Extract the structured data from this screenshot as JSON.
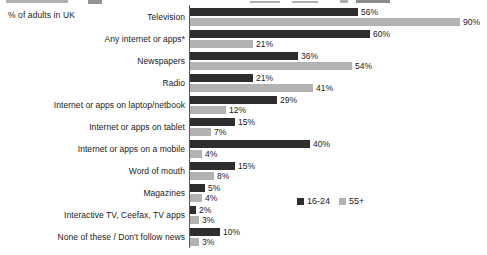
{
  "axis_caption": "% of adults in UK",
  "legend": {
    "position": "inside-right-middle",
    "entries": [
      {
        "label": "16-24",
        "color": "#2e2e2e"
      },
      {
        "label": "55+",
        "color": "#b2b2b2"
      }
    ]
  },
  "chart_data": {
    "type": "bar",
    "orientation": "horizontal",
    "title": "",
    "subtitle": "",
    "xlabel": "% of adults in UK",
    "ylabel": "",
    "xlim": [
      0,
      90
    ],
    "grid": false,
    "value_suffix": "%",
    "legend_position": "inside-right-middle",
    "categories": [
      "Television",
      "Any internet or apps*",
      "Newspapers",
      "Radio",
      "Internet or apps on laptop/netbook",
      "Internet or apps on tablet",
      "Internet or apps on a mobile",
      "Word of mouth",
      "Magazines",
      "Interactive TV, Ceefax, TV apps",
      "None of these / Don't follow news"
    ],
    "series": [
      {
        "name": "16-24",
        "color": "#2e2e2e",
        "values": [
          56,
          60,
          36,
          21,
          29,
          15,
          40,
          15,
          5,
          2,
          10
        ],
        "labels": [
          "56%",
          "60%",
          "36%",
          "21%",
          "29%",
          "15%",
          "40%",
          "15%",
          "5%",
          "2%",
          "10%"
        ]
      },
      {
        "name": "55+",
        "color": "#b2b2b2",
        "values": [
          90,
          21,
          54,
          41,
          12,
          7,
          4,
          8,
          4,
          3,
          3
        ],
        "labels": [
          "90%",
          "21%",
          "54%",
          "41%",
          "12%",
          "7%",
          "4%",
          "8%",
          "4%",
          "3%",
          "3%"
        ]
      }
    ]
  }
}
